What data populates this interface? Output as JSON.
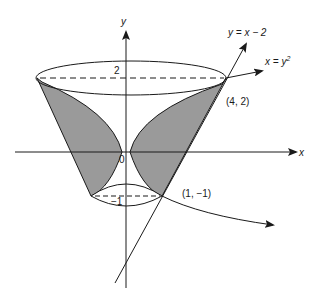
{
  "figure": {
    "axes": {
      "x_label": "x",
      "y_label": "y",
      "origin_label": "0"
    },
    "curves": {
      "line_label": "y = x − 2",
      "parabola_label_prefix": "x = y",
      "parabola_label_exp": "2"
    },
    "points": {
      "upper_point": "(4, 2)",
      "lower_point": "(1, −1)"
    },
    "ticks": {
      "y_top": "2",
      "y_bottom": "−1"
    },
    "colors": {
      "shade": "#9a9a9a",
      "stroke": "#1a1a1a",
      "background": "#ffffff"
    }
  }
}
